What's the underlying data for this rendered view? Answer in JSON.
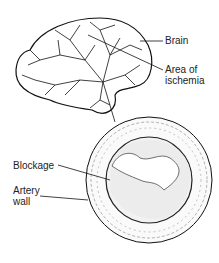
{
  "diagram": {
    "labels": {
      "brain": "Brain",
      "ischemia_line1": "Area of",
      "ischemia_line2": "ischemia",
      "blockage": "Blockage",
      "artery_line1": "Artery",
      "artery_line2": "wall"
    }
  }
}
